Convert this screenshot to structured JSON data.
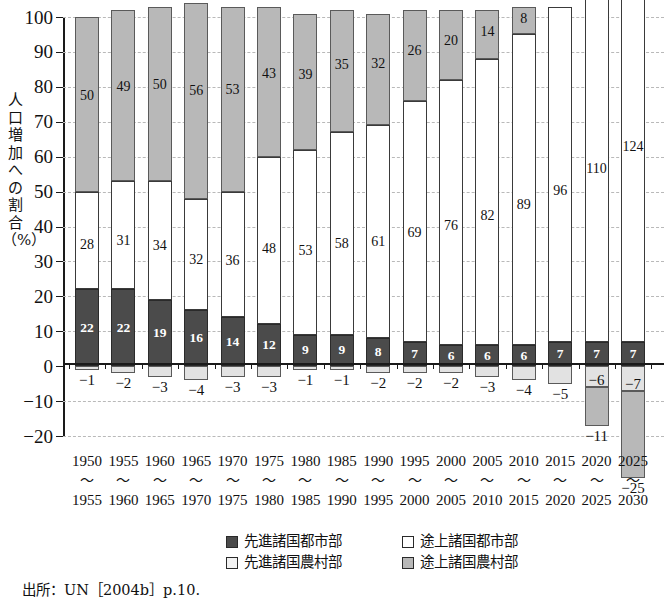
{
  "axis": {
    "ylabel": "人口増加への割合（%）",
    "ylabel_chars": [
      "人",
      "口",
      "増",
      "加",
      "へ",
      "の",
      "割",
      "合",
      "（%）"
    ],
    "yticks": [
      "100",
      "90",
      "80",
      "70",
      "60",
      "50",
      "40",
      "30",
      "20",
      "10",
      "0",
      "−10",
      "−20"
    ]
  },
  "legend": {
    "items": [
      {
        "key": "dev-urban",
        "label": "先進諸国都市部",
        "color": "#4b4b4b"
      },
      {
        "key": "ldc-urban",
        "label": "途上諸国都市部",
        "color": "#ffffff"
      },
      {
        "key": "dev-rural",
        "label": "先進諸国農村部",
        "color": "#f2f2f2"
      },
      {
        "key": "ldc-rural",
        "label": "途上諸国農村部",
        "color": "#b8b8b8"
      }
    ]
  },
  "source": "出所：UN［2004b］p.10.",
  "chart_data": {
    "type": "bar",
    "title": "",
    "xlabel": "",
    "ylabel": "人口増加への割合（%）",
    "ylim": [
      -20,
      100
    ],
    "grid": true,
    "stacked": true,
    "legend_position": "bottom",
    "categories": [
      "1950〜1955",
      "1955〜1960",
      "1960〜1965",
      "1965〜1970",
      "1970〜1975",
      "1975〜1980",
      "1980〜1985",
      "1985〜1990",
      "1990〜1995",
      "1995〜2000",
      "2000〜2005",
      "2005〜2010",
      "2010〜2015",
      "2015〜2020",
      "2020〜2025",
      "2025〜2030"
    ],
    "period_start": [
      "1950",
      "1955",
      "1960",
      "1965",
      "1970",
      "1975",
      "1980",
      "1985",
      "1990",
      "1995",
      "2000",
      "2005",
      "2010",
      "2015",
      "2020",
      "2025"
    ],
    "period_end": [
      "1955",
      "1960",
      "1965",
      "1970",
      "1975",
      "1980",
      "1985",
      "1990",
      "1995",
      "2000",
      "2005",
      "2010",
      "2015",
      "2020",
      "2025",
      "2030"
    ],
    "series": [
      {
        "name": "先進諸国都市部",
        "key": "dev-urban",
        "color": "#4b4b4b",
        "values": [
          22,
          22,
          19,
          16,
          14,
          12,
          9,
          9,
          8,
          7,
          6,
          6,
          6,
          7,
          7,
          7
        ]
      },
      {
        "name": "途上諸国都市部",
        "key": "ldc-urban",
        "color": "#ffffff",
        "values": [
          28,
          31,
          34,
          32,
          36,
          48,
          53,
          58,
          61,
          69,
          76,
          82,
          89,
          96,
          110,
          124
        ]
      },
      {
        "name": "途上諸国農村部",
        "key": "ldc-rural",
        "color": "#b8b8b8",
        "values": [
          50,
          49,
          50,
          56,
          53,
          43,
          39,
          35,
          32,
          26,
          20,
          14,
          8,
          0,
          -11,
          -25
        ]
      },
      {
        "name": "先進諸国農村部",
        "key": "dev-rural",
        "color": "#e2e2e2",
        "values": [
          -1,
          -2,
          -3,
          -4,
          -3,
          -3,
          -1,
          -1,
          -2,
          -2,
          -2,
          -3,
          -4,
          -5,
          -6,
          -7
        ]
      }
    ]
  }
}
